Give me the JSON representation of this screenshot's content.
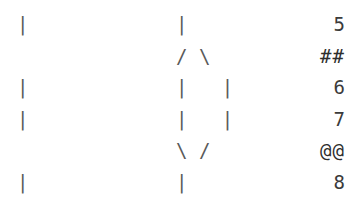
{
  "graph": {
    "type": "ascii-commit-graph",
    "background_color": "#ffffff",
    "glyph_color": "#5a5a5a",
    "label_color": "#3b3b3b",
    "columns": [
      "left-lane",
      "center-lane",
      "right-label"
    ],
    "rows": [
      {
        "left": "|",
        "center": "|",
        "right": "5",
        "right_kind": "number"
      },
      {
        "left": " ",
        "center": "/ \\",
        "right": "##",
        "right_kind": "marker"
      },
      {
        "left": "|",
        "center": "|   |",
        "right": "6",
        "right_kind": "number"
      },
      {
        "left": "|",
        "center": "|   |",
        "right": "7",
        "right_kind": "number"
      },
      {
        "left": " ",
        "center": "\\ /",
        "right": "@@",
        "right_kind": "marker"
      },
      {
        "left": "|",
        "center": "|",
        "right": "8",
        "right_kind": "number"
      }
    ]
  }
}
